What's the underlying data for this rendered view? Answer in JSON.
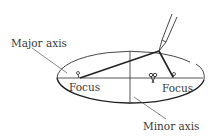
{
  "diagram": {
    "labels": {
      "major_axis": "Major axis",
      "minor_axis": "Minor axis",
      "focus_left": "Focus",
      "focus_right": "Focus"
    },
    "elements": {
      "ellipse": {
        "cx": 130,
        "cy": 78,
        "rx": 74,
        "ry": 27
      },
      "major_axis_line": {
        "x1": 57,
        "y1": 78,
        "x2": 203,
        "y2": 78
      },
      "minor_axis_line": {
        "x1": 130,
        "y1": 51,
        "x2": 130,
        "y2": 104
      },
      "focus_left": {
        "x": 79,
        "y": 78
      },
      "focus_right": {
        "x": 173,
        "y": 78
      },
      "pencil_tip": {
        "x": 159,
        "y": 51
      },
      "string_knot": {
        "x": 153,
        "y": 78
      }
    },
    "colors": {
      "line": "#222222",
      "thin_line": "#555555",
      "text": "#3a3a3a"
    }
  }
}
